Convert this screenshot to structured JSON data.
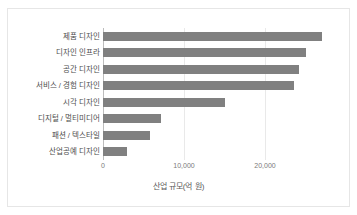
{
  "chart_data": {
    "type": "bar",
    "orientation": "horizontal",
    "title": "",
    "subtitle": "",
    "xlabel": "산업 규모(억 원)",
    "ylabel": "",
    "categories": [
      "제품 디자인",
      "디자인 인프라",
      "공간 디자인",
      "서비스 / 경험 디자인",
      "시각 디자인",
      "디지털 / 멀티미디어",
      "패션 / 텍스타일",
      "산업공예 디자인"
    ],
    "values": [
      27000,
      25000,
      24200,
      23600,
      15000,
      7100,
      5800,
      3000
    ],
    "xlim": [
      0,
      29500
    ],
    "xticks": [
      0,
      10000,
      20000
    ],
    "xticklabels": [
      "0",
      "10,000",
      "20,000"
    ],
    "grid": "vertical",
    "legend": "none",
    "bar_color": "#808080",
    "gridline_color": "#e9e9e9",
    "axis_color": "#bdbdbd",
    "frame_color": "#e6e6e6",
    "background": "#ffffff"
  }
}
